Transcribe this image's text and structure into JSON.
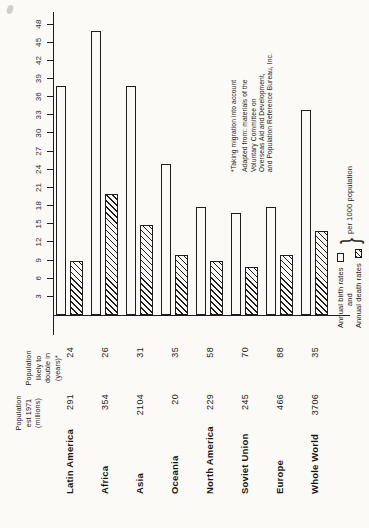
{
  "page": {
    "background": "#fbfaf6",
    "ink": "#1d1d1d"
  },
  "chart_data": {
    "type": "bar",
    "layout_note": "horizontal paired bars, whole chart printed rotated 90° CCW on portrait page",
    "categories": [
      "Latin America",
      "Africa",
      "Asia",
      "Oceania",
      "North America",
      "Soviet Union",
      "Europe",
      "Whole World"
    ],
    "series": [
      {
        "name": "Annual birth rates",
        "style": "outline",
        "values": [
          38,
          47,
          38,
          25,
          18,
          17,
          18,
          34
        ]
      },
      {
        "name": "Annual death rates",
        "style": "hatched",
        "values": [
          9,
          20,
          15,
          10,
          9,
          8,
          10,
          14
        ]
      }
    ],
    "value_axis": {
      "min": 0,
      "max": 48,
      "tick_start": 3,
      "tick_step": 3,
      "ticks": [
        3,
        6,
        9,
        12,
        15,
        18,
        21,
        24,
        27,
        30,
        33,
        36,
        39,
        42,
        45,
        48
      ],
      "unit": "per 1000 population",
      "grid": "off"
    },
    "columns": [
      {
        "header_lines": [
          "Population",
          "est 1971",
          "(millions)"
        ],
        "values": [
          "291",
          "354",
          "2104",
          "20",
          "229",
          "245",
          "466",
          "3706"
        ]
      },
      {
        "header_lines": [
          "Population",
          "likely to",
          "double in",
          "(years)*"
        ],
        "values": [
          "24",
          "26",
          "31",
          "35",
          "58",
          "70",
          "88",
          "35"
        ]
      }
    ],
    "legend": {
      "birth_label": "Annual birth rates",
      "and_label": "and",
      "death_label": "Annual death rates",
      "brace": "}",
      "unit_label": "per 1000 population",
      "position": "bottom-right of landscape chart"
    },
    "annotation_lines": [
      "*Taking migration into account",
      "Adapted from: materials of the",
      "Voluntary Committee on",
      "Overseas Aid and Development,",
      "and Population Reference Bureau, Inc."
    ]
  }
}
